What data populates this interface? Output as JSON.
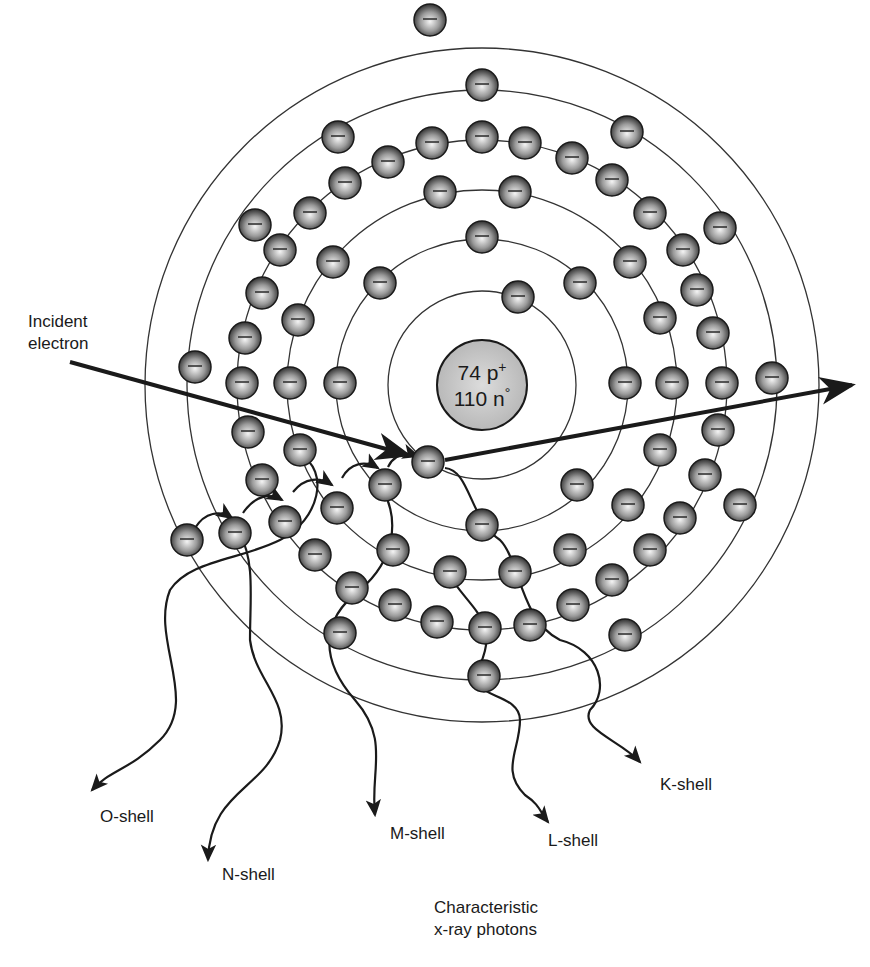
{
  "nucleus": {
    "protons_label": "74 p+",
    "neutrons_label": "110 n°",
    "protons_text": "74 p",
    "protons_sup": "+",
    "neutrons_text": "110 n",
    "neutrons_sup": "°",
    "cx": 482,
    "cy": 385,
    "r": 45,
    "fill": "#c4c4c4"
  },
  "shells": [
    {
      "name": "K",
      "r": 94
    },
    {
      "name": "L",
      "r": 146
    },
    {
      "name": "M",
      "r": 195
    },
    {
      "name": "N",
      "r": 245
    },
    {
      "name": "O",
      "r": 295
    },
    {
      "name": "P",
      "r": 337
    }
  ],
  "electron": {
    "r": 16,
    "glyph": "−"
  },
  "electrons": [
    [
      428,
      462
    ],
    [
      518,
      297
    ],
    [
      482,
      237
    ],
    [
      380,
      283
    ],
    [
      580,
      283
    ],
    [
      340,
      383
    ],
    [
      625,
      383
    ],
    [
      385,
      485
    ],
    [
      577,
      485
    ],
    [
      482,
      525
    ],
    [
      440,
      192
    ],
    [
      515,
      192
    ],
    [
      333,
      262
    ],
    [
      630,
      262
    ],
    [
      298,
      320
    ],
    [
      660,
      318
    ],
    [
      290,
      383
    ],
    [
      672,
      383
    ],
    [
      300,
      450
    ],
    [
      660,
      450
    ],
    [
      337,
      508
    ],
    [
      628,
      505
    ],
    [
      393,
      550
    ],
    [
      570,
      550
    ],
    [
      450,
      572
    ],
    [
      515,
      572
    ],
    [
      395,
      605
    ],
    [
      437,
      622
    ],
    [
      482,
      137
    ],
    [
      432,
      143
    ],
    [
      525,
      143
    ],
    [
      388,
      162
    ],
    [
      572,
      158
    ],
    [
      345,
      183
    ],
    [
      612,
      180
    ],
    [
      310,
      213
    ],
    [
      650,
      213
    ],
    [
      280,
      250
    ],
    [
      683,
      250
    ],
    [
      262,
      293
    ],
    [
      697,
      290
    ],
    [
      245,
      338
    ],
    [
      713,
      333
    ],
    [
      242,
      383
    ],
    [
      722,
      383
    ],
    [
      248,
      432
    ],
    [
      718,
      430
    ],
    [
      262,
      480
    ],
    [
      705,
      475
    ],
    [
      285,
      522
    ],
    [
      680,
      518
    ],
    [
      315,
      555
    ],
    [
      650,
      550
    ],
    [
      352,
      588
    ],
    [
      612,
      580
    ],
    [
      485,
      628
    ],
    [
      530,
      625
    ],
    [
      573,
      605
    ],
    [
      338,
      137
    ],
    [
      627,
      132
    ],
    [
      255,
      225
    ],
    [
      720,
      228
    ],
    [
      195,
      367
    ],
    [
      772,
      378
    ],
    [
      235,
      533
    ],
    [
      740,
      505
    ],
    [
      187,
      540
    ],
    [
      340,
      633
    ],
    [
      625,
      635
    ],
    [
      484,
      676
    ],
    [
      482,
      85
    ],
    [
      430,
      20
    ]
  ],
  "incident_electron": {
    "label_line1": "Incident",
    "label_line2": "electron",
    "in_path": {
      "x1": 70,
      "y1": 362,
      "x2": 410,
      "y2": 455
    },
    "out_path": {
      "x1": 445,
      "y1": 460,
      "x2": 860,
      "y2": 383
    }
  },
  "photons": [
    {
      "shell": "O-shell",
      "label": "O-shell",
      "label_x": 100,
      "label_y": 800
    },
    {
      "shell": "N-shell",
      "label": "N-shell",
      "label_x": 220,
      "label_y": 860
    },
    {
      "shell": "M-shell",
      "label": "M-shell",
      "label_x": 390,
      "label_y": 823
    },
    {
      "shell": "L-shell",
      "label": "L-shell",
      "label_x": 548,
      "label_y": 830
    },
    {
      "shell": "K-shell",
      "label": "K-shell",
      "label_x": 660,
      "label_y": 773
    }
  ],
  "caption": {
    "line1": "Characteristic",
    "line2": "x-ray photons"
  },
  "colors": {
    "line": "#1a1a1a",
    "shell_line": "#333333",
    "electron_dark": "#3a3a3a",
    "electron_light": "#f2f2f2"
  }
}
